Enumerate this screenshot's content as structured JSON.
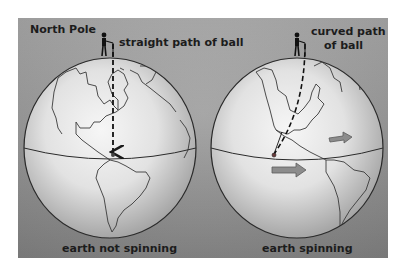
{
  "figure": {
    "top_left_label": "North Pole",
    "left_panel": {
      "path_label": "straight path of ball",
      "caption": "earth not spinning"
    },
    "right_panel": {
      "path_label_line1": "curved path",
      "path_label_line2": "of ball",
      "caption": "earth spinning"
    }
  },
  "colors": {
    "background_top": "#a9a9a9",
    "background_bottom": "#858585",
    "globe_center": "#f4f4f4",
    "globe_edge": "#a8a8a8",
    "arrow_fill": "#8a8a8a",
    "outline": "#2a2a2a"
  }
}
